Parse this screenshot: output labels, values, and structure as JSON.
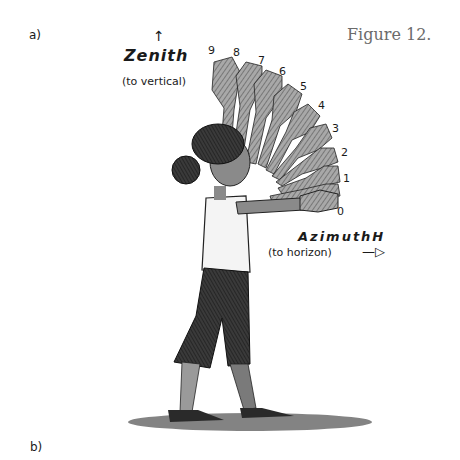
{
  "figure": {
    "title": "Figure 12.",
    "panel_a_label": "a)",
    "panel_b_label": "b)"
  },
  "zenith": {
    "arrow": "↑",
    "label": "Zenith",
    "sublabel": "(to vertical)"
  },
  "azimuth": {
    "label": "AzimuthH",
    "sublabel": "(to horizon)",
    "arrow": "—▷"
  },
  "hand_positions": [
    {
      "n": "0",
      "x": 337,
      "y": 205
    },
    {
      "n": "1",
      "x": 343,
      "y": 172
    },
    {
      "n": "2",
      "x": 341,
      "y": 146
    },
    {
      "n": "3",
      "x": 332,
      "y": 122
    },
    {
      "n": "4",
      "x": 318,
      "y": 99
    },
    {
      "n": "5",
      "x": 300,
      "y": 80
    },
    {
      "n": "6",
      "x": 279,
      "y": 65
    },
    {
      "n": "7",
      "x": 258,
      "y": 54
    },
    {
      "n": "8",
      "x": 233,
      "y": 46
    },
    {
      "n": "9",
      "x": 208,
      "y": 44
    }
  ],
  "colors": {
    "ink": "#1a1a1a",
    "hand_fill": "#9a9a9a",
    "skin": "#8a8a8a",
    "pants": "#3a3a3a",
    "shadow": "#5a5a5a",
    "title_gray": "#6b6b6b"
  }
}
